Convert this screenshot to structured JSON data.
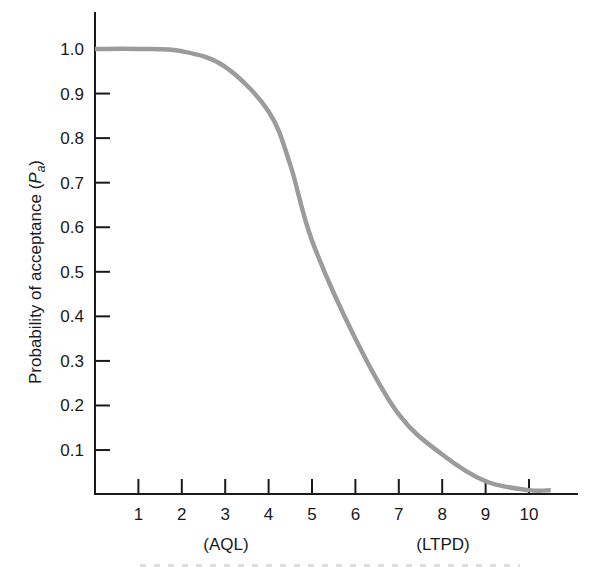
{
  "chart_data": {
    "type": "line",
    "title": "",
    "xlabel": "",
    "ylabel": "Probability of acceptance (P_a)",
    "ylabel_main": "Probability of acceptance (",
    "ylabel_symbol": "P",
    "ylabel_subscript": "a",
    "ylabel_close": ")",
    "xlim": [
      0,
      11
    ],
    "ylim": [
      0,
      1.1
    ],
    "grid": false,
    "x_ticks": [
      "1",
      "2",
      "3",
      "4",
      "5",
      "6",
      "7",
      "8",
      "9",
      "10"
    ],
    "y_ticks": [
      "0.1",
      "0.2",
      "0.3",
      "0.4",
      "0.5",
      "0.6",
      "0.7",
      "0.8",
      "0.9",
      "1.0"
    ],
    "annotations": [
      {
        "text": "(AQL)",
        "x": 3
      },
      {
        "text": "(LTPD)",
        "x": 8
      }
    ],
    "series": [
      {
        "name": "OC curve",
        "color": "#9b9b9b",
        "x": [
          0,
          1,
          2,
          3,
          4,
          4.5,
          5,
          6,
          7,
          8,
          9,
          10,
          10.5
        ],
        "values": [
          1.0,
          1.0,
          0.995,
          0.96,
          0.86,
          0.74,
          0.57,
          0.35,
          0.18,
          0.09,
          0.03,
          0.01,
          0.01
        ]
      }
    ]
  },
  "style": {
    "axis_color": "#1a1a1a",
    "curve_color": "#9b9b9b"
  }
}
